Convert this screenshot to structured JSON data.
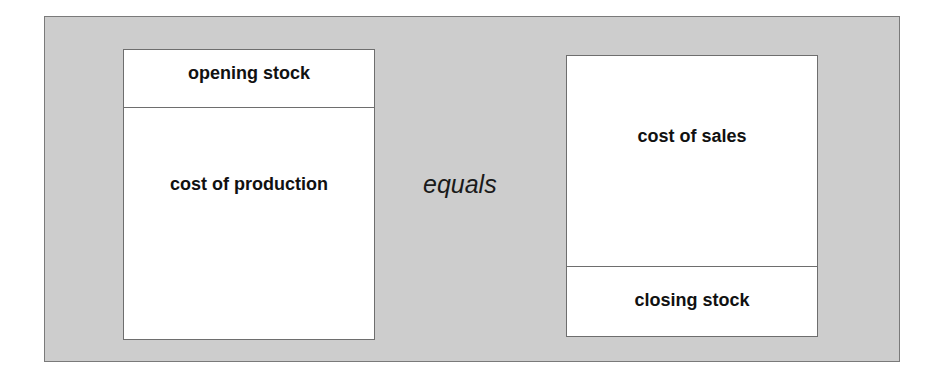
{
  "diagram": {
    "left_box": {
      "top_label": "opening stock",
      "main_label": "cost of production"
    },
    "connector": "equals",
    "right_box": {
      "main_label": "cost of sales",
      "bottom_label": "closing stock"
    },
    "colors": {
      "background_panel": "#cdcdcd",
      "box_fill": "#ffffff",
      "border": "#6e6e6e"
    }
  }
}
